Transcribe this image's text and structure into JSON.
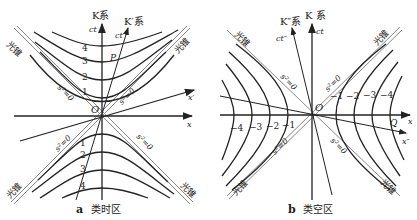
{
  "panel_a": {
    "caption_letter": "a",
    "caption_text": "类时区",
    "frame_k": "K系",
    "frame_k_prime": "K′系",
    "axis_ct": "ct",
    "axis_ct_prime": "ct′",
    "axis_x": "x",
    "axis_x_prime": "x′",
    "origin": "O",
    "point": "P",
    "light_cone": "光锥",
    "null_label": "s²=0",
    "upper_curve_labels": [
      "1",
      "2",
      "3",
      "4"
    ],
    "lower_curve_labels": [
      "1",
      "2",
      "3",
      "4"
    ]
  },
  "panel_b": {
    "caption_letter": "b",
    "caption_text": "类空区",
    "frame_k": "K 系",
    "frame_k_double_prime": "K″系",
    "axis_ct": "ct",
    "axis_ct_double_prime": "ct″",
    "axis_x": "x",
    "axis_x_double_prime": "x″",
    "origin": "O",
    "point": "Q",
    "light_cone": "光锥",
    "null_label": "s²=0",
    "right_curve_labels": [
      "−1",
      "−2",
      "−3",
      "−4"
    ],
    "left_curve_labels": [
      "−4",
      "−3",
      "−2",
      "−1"
    ]
  },
  "colors": {
    "ink": "#222222",
    "light_cone": "#888888",
    "background": "#ffffff"
  }
}
